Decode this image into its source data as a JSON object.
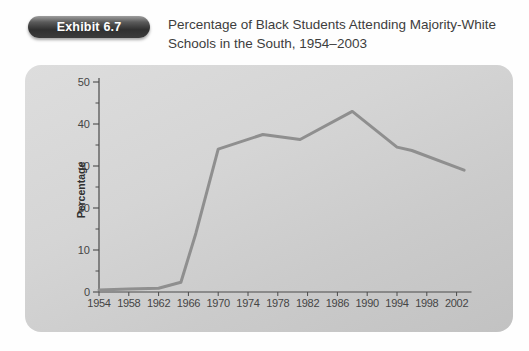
{
  "header": {
    "badge_label": "Exhibit 6.7",
    "title": "Percentage of Black Students Attending Majority-White Schools in the South, 1954–2003"
  },
  "chart_data": {
    "type": "line",
    "title": "Percentage of Black Students Attending Majority-White Schools in the South, 1954–2003",
    "xlabel": "",
    "ylabel": "Percentage",
    "xlim": [
      1954,
      2004
    ],
    "ylim": [
      0,
      50
    ],
    "x_ticks": [
      1954,
      1958,
      1962,
      1966,
      1970,
      1974,
      1978,
      1982,
      1986,
      1990,
      1994,
      1998,
      2002
    ],
    "y_ticks": [
      0,
      10,
      20,
      30,
      40,
      50
    ],
    "y_minor_ticks": [
      5,
      15,
      25,
      35,
      45
    ],
    "grid": false,
    "legend": "none",
    "series": [
      {
        "name": "Percent of Black students in majority-white schools",
        "x": [
          1954,
          1958,
          1962,
          1965,
          1967,
          1970,
          1976,
          1981,
          1988,
          1994,
          1996,
          2003
        ],
        "y": [
          0.5,
          0.7,
          0.9,
          2.3,
          14,
          34,
          37.5,
          36.3,
          43,
          34.5,
          33.7,
          29
        ]
      }
    ]
  },
  "colors": {
    "line": "#8f8f8f",
    "axis": "#4a4a4a",
    "tick_label": "#454545",
    "panel_light": "#dddddd",
    "panel_dark": "#c2c2c2",
    "badge_bg": "#303030",
    "badge_text": "#ffffff",
    "title_text": "#3d3d3d"
  }
}
